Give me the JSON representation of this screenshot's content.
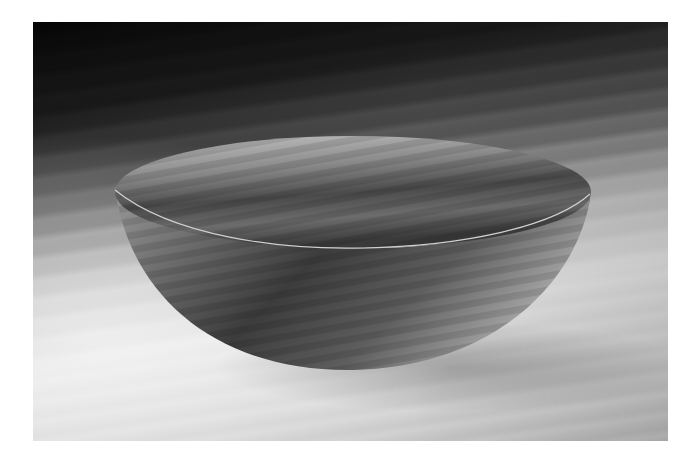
{
  "image": {
    "description": "Grayscale studio photograph of a smooth hemispherical bowl on a softly lit surface with diagonal streaked light and shadow",
    "subject": "bowl",
    "palette": {
      "background_dark": "#050505",
      "background_mid": "#7a7a7a",
      "background_light": "#e6e6e6",
      "bowl_rim_light": "#bdbdbd",
      "bowl_interior_dark": "#3a3a3a",
      "bowl_exterior": "#6e6e6e"
    }
  }
}
